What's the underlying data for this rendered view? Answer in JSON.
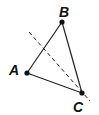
{
  "diagram": {
    "points": [
      {
        "name": "A",
        "x": 27,
        "y": 73
      },
      {
        "name": "B",
        "x": 62,
        "y": 22
      },
      {
        "name": "C",
        "x": 82,
        "y": 93
      }
    ],
    "labels": {
      "A": "A",
      "B": "B",
      "C": "C"
    },
    "dashed_line": {
      "x1": 29,
      "y1": 32,
      "x2": 90,
      "y2": 101
    },
    "colors": {
      "stroke": "#222222",
      "point": "#111111"
    }
  }
}
